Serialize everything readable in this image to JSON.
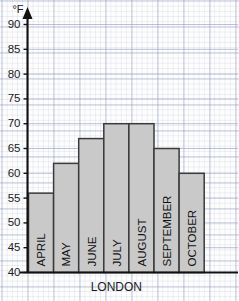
{
  "chart_data": {
    "type": "bar",
    "title": "",
    "xlabel": "LONDON",
    "ylabel": "°F",
    "categories": [
      "APRIL",
      "MAY",
      "JUNE",
      "JULY",
      "AUGUST",
      "SEPTEMBER",
      "OCTOBER"
    ],
    "values": [
      56,
      62,
      67,
      70,
      70,
      65,
      60
    ],
    "ylim": [
      40,
      90
    ],
    "ytick_step": 5,
    "yticks": [
      40,
      45,
      50,
      55,
      60,
      65,
      70,
      75,
      80,
      85,
      90
    ],
    "ytick_labels": [
      "40",
      "45",
      "50",
      "55",
      "60",
      "65",
      "70",
      "75",
      "80",
      "85",
      "90"
    ],
    "grid": true,
    "legend": null,
    "bar_fill_color": "#c9c9c9",
    "bar_border_color": "#3a3a3a",
    "axis_color": "#111111",
    "grid_color": "#7887af",
    "background_color": "#fdfdfd",
    "y_axis_has_arrow": true,
    "bar_labels_rotated": true
  },
  "axes": {
    "y_unit": "°F",
    "x_caption": "LONDON"
  }
}
